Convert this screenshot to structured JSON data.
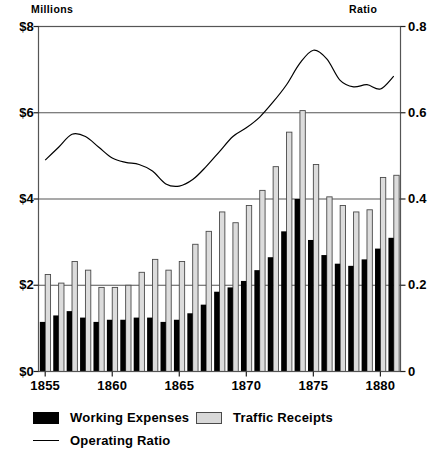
{
  "labels": {
    "left_unit": "Millions",
    "right_unit": "Ratio"
  },
  "legend": {
    "items": [
      {
        "label": "Working Expenses",
        "swatch": "black-filled-rect",
        "color": "#000000"
      },
      {
        "label": "Traffic Receipts",
        "swatch": "gray-hatched-rect",
        "color": "#d8d8d8"
      },
      {
        "label": "Operating Ratio",
        "swatch": "line-segment",
        "color": "#000000"
      }
    ]
  },
  "chart_data": {
    "type": "bar",
    "title": "",
    "xlabel": "",
    "ylabel": "Millions",
    "y2label": "Ratio",
    "grid": true,
    "legend_position": "bottom-left",
    "xlim": [
      1854.5,
      1881.5
    ],
    "ylim": [
      0,
      8
    ],
    "y2lim": [
      0,
      0.8
    ],
    "yticks": [
      0,
      2,
      4,
      6,
      8
    ],
    "ytick_labels": [
      "$0",
      "$2",
      "$4",
      "$6",
      "$8"
    ],
    "y2ticks": [
      0,
      0.2,
      0.4,
      0.6,
      0.8
    ],
    "y2tick_labels": [
      "0",
      "0.2",
      "0.4",
      "0.6",
      "0.8"
    ],
    "xticks": [
      1855,
      1860,
      1865,
      1870,
      1875,
      1880
    ],
    "xtick_labels": [
      "1855",
      "1860",
      "1865",
      "1870",
      "1875",
      "1880"
    ],
    "categories": [
      1855,
      1856,
      1857,
      1858,
      1859,
      1860,
      1861,
      1862,
      1863,
      1864,
      1865,
      1866,
      1867,
      1868,
      1869,
      1870,
      1871,
      1872,
      1873,
      1874,
      1875,
      1876,
      1877,
      1878,
      1879,
      1880,
      1881
    ],
    "series": [
      {
        "name": "Working Expenses",
        "axis": "left",
        "style": "bar-black",
        "values": [
          1.15,
          1.3,
          1.4,
          1.25,
          1.15,
          1.2,
          1.2,
          1.25,
          1.25,
          1.15,
          1.2,
          1.35,
          1.55,
          1.85,
          1.95,
          2.1,
          2.35,
          2.65,
          3.25,
          4.0,
          3.05,
          2.7,
          2.5,
          2.45,
          2.6,
          2.85,
          3.1
        ]
      },
      {
        "name": "Traffic Receipts",
        "axis": "left",
        "style": "bar-gray",
        "values": [
          2.25,
          2.05,
          2.55,
          2.35,
          1.95,
          1.95,
          2.0,
          2.3,
          2.6,
          2.35,
          2.55,
          2.95,
          3.25,
          3.7,
          3.45,
          3.85,
          4.2,
          4.75,
          5.55,
          6.05,
          4.8,
          4.05,
          3.85,
          3.7,
          3.75,
          4.5,
          4.55
        ]
      },
      {
        "name": "Operating Ratio",
        "axis": "right",
        "style": "line",
        "values": [
          0.49,
          0.52,
          0.55,
          0.545,
          0.52,
          0.495,
          0.485,
          0.48,
          0.465,
          0.435,
          0.43,
          0.445,
          0.475,
          0.51,
          0.545,
          0.565,
          0.59,
          0.625,
          0.665,
          0.715,
          0.745,
          0.725,
          0.675,
          0.66,
          0.665,
          0.655,
          0.685
        ]
      }
    ]
  }
}
